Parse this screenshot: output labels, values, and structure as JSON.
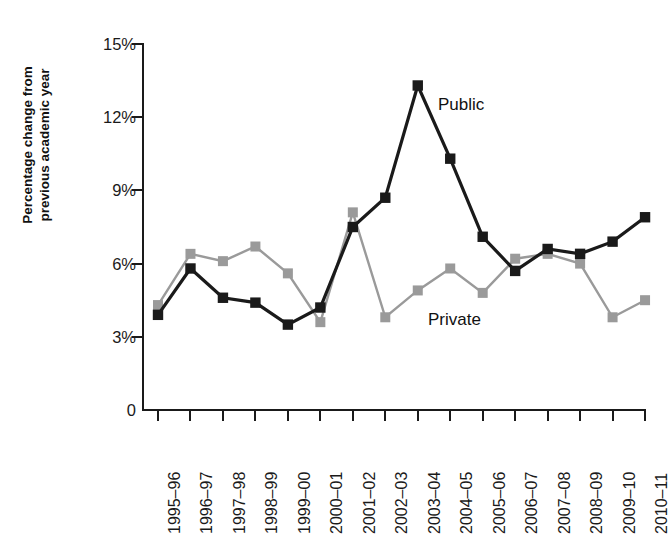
{
  "chart_data": {
    "type": "line",
    "title": "",
    "xlabel": "",
    "ylabel": "Percentage change from previous academic year",
    "ylabel_line1": "Percentage change from",
    "ylabel_line2": "previous academic year",
    "categories": [
      "1995–96",
      "1996–97",
      "1997–98",
      "1998–99",
      "1999–00",
      "2000–01",
      "2001–02",
      "2002–03",
      "2003–04",
      "2004–05",
      "2005–06",
      "2006–07",
      "2007–08",
      "2008–09",
      "2009–10",
      "2010–11"
    ],
    "ylim": [
      0,
      15
    ],
    "yticks": [
      0,
      3,
      6,
      9,
      12,
      15
    ],
    "ytick_labels": [
      "0",
      "3%",
      "6%",
      "9%",
      "12%",
      "15%"
    ],
    "grid": false,
    "legend_position": "inline-annotations",
    "series": [
      {
        "name": "Public",
        "color": "#1a1a1a",
        "marker": "square",
        "label_annotation": "Public",
        "values": [
          3.9,
          5.8,
          4.6,
          4.4,
          3.5,
          4.2,
          7.5,
          8.7,
          13.3,
          10.3,
          7.1,
          5.7,
          6.6,
          6.4,
          6.9,
          7.9
        ]
      },
      {
        "name": "Private",
        "color": "#9a9a9a",
        "marker": "square",
        "label_annotation": "Private",
        "values": [
          4.3,
          6.4,
          6.1,
          6.7,
          5.6,
          3.6,
          8.1,
          3.8,
          4.9,
          5.8,
          4.8,
          6.2,
          6.4,
          6.0,
          3.8,
          4.5
        ]
      }
    ],
    "annotations": [
      {
        "text": "Public",
        "series": "Public",
        "near_category": "2003–04"
      },
      {
        "text": "Private",
        "series": "Private",
        "near_category": "2003–04"
      }
    ]
  },
  "axes": {
    "y_axis_color": "#1a1a1a",
    "x_axis_color": "#1a1a1a"
  }
}
